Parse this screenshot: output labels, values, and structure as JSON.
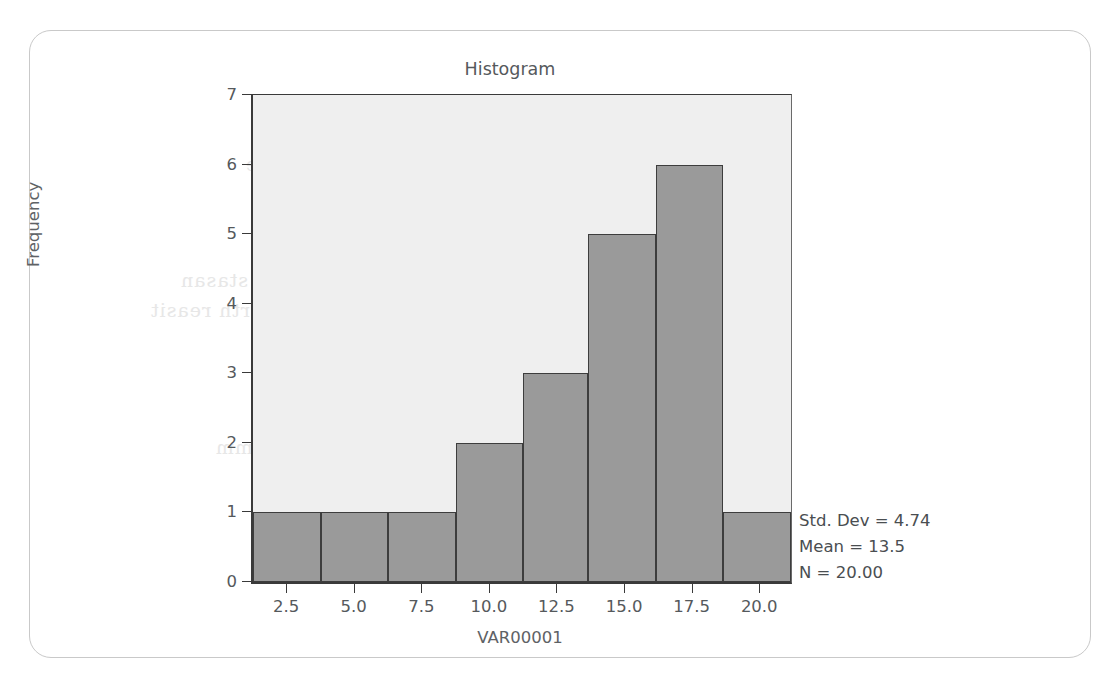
{
  "card": {
    "border_color": "#c9c9c9"
  },
  "chart_data": {
    "type": "bar",
    "title": "Histogram",
    "xlabel": "VAR00001",
    "ylabel": "Frequency",
    "categories": [
      "1.2-3.7",
      "3.7-6.2",
      "6.2-8.7",
      "8.7-11.2",
      "11.2-13.6",
      "13.6-16.1",
      "16.1-18.6",
      "18.6-21.1"
    ],
    "values": [
      1,
      1,
      1,
      2,
      3,
      5,
      6,
      1
    ],
    "bin_edges": [
      1.2,
      3.7,
      6.2,
      8.7,
      11.2,
      13.6,
      16.1,
      18.6,
      21.1
    ],
    "xlim": [
      1.2,
      21.1
    ],
    "ylim": [
      0,
      7
    ],
    "x_ticks": [
      2.5,
      5.0,
      7.5,
      10.0,
      12.5,
      15.0,
      17.5,
      20.0
    ],
    "x_tick_labels": [
      "2.5",
      "5.0",
      "7.5",
      "10.0",
      "12.5",
      "15.0",
      "17.5",
      "20.0"
    ],
    "y_ticks": [
      0,
      1,
      2,
      3,
      4,
      5,
      6,
      7
    ],
    "y_tick_labels": [
      "0",
      "1",
      "2",
      "3",
      "4",
      "5",
      "6",
      "7"
    ],
    "grid": false,
    "legend": "none",
    "bar_color": "#9a9a9a",
    "bar_edge_color": "#3d3d3d",
    "plot_background": "#efefef",
    "annotations": {
      "std_dev": "Std. Dev = 4.74",
      "mean": "Mean = 13.5",
      "n": "N = 20.00"
    }
  },
  "ghost_text": {
    "line1": "ancient latent nature",
    "line2": "amiro nn stasan",
    "line3": "anter tnorth reasit",
    "line4": "nation won",
    "line5": "antera amm",
    "line6": "ante nnorau"
  }
}
